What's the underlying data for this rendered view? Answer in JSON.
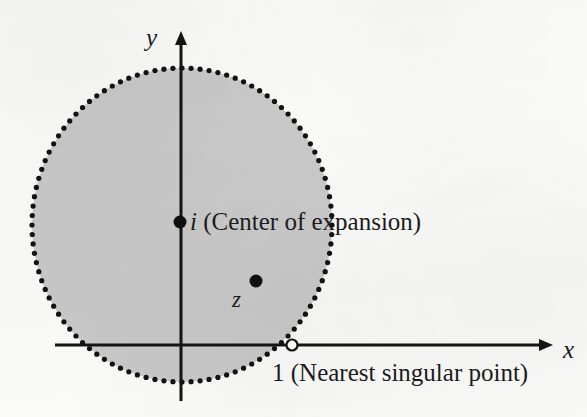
{
  "figure": {
    "kind": "complex-plane-disk-of-convergence",
    "width": 587,
    "height": 417,
    "background_color": "#fbfbfa"
  },
  "axes": {
    "x_axis": {
      "label": "x",
      "label_x": 563,
      "label_y": 337,
      "line_y": 345,
      "line_x_start": 55,
      "line_x_end": 540,
      "arrow_tip_x": 556,
      "color": "#141414",
      "width": 3
    },
    "y_axis": {
      "label": "y",
      "label_x": 146,
      "label_y": 25,
      "line_x": 181,
      "line_y_start": 44,
      "line_y_end": 401,
      "arrow_tip_y": 23,
      "color": "#141414",
      "width": 3
    }
  },
  "disk": {
    "name": "circle-of-convergence",
    "center_x": 182,
    "center_y": 225,
    "radius_x": 150,
    "radius_y": 157,
    "fill_color": "#c9c9c9",
    "boundary_style": "dotted",
    "boundary_color": "#121212",
    "boundary_dot_radius": 2.6,
    "boundary_dot_count": 104
  },
  "points": [
    {
      "id": "center-of-expansion",
      "symbol": "i",
      "annotation": "(Center of expansion)",
      "marker": "filled-dot",
      "x": 180,
      "y": 222,
      "radius": 6.5,
      "color": "#101010",
      "label_x": 190,
      "label_y": 209
    },
    {
      "id": "point-z",
      "symbol": "z",
      "annotation": "",
      "marker": "filled-dot",
      "x": 256,
      "y": 281,
      "radius": 6.5,
      "color": "#101010",
      "label_x": 232,
      "label_y": 288
    },
    {
      "id": "nearest-singular-point",
      "symbol": "1",
      "annotation": "(Nearest singular point)",
      "marker": "open-dot",
      "x": 292,
      "y": 345,
      "radius": 5.5,
      "color": "#151515",
      "label_x": 272,
      "label_y": 360
    }
  ],
  "annotations": {
    "center_label": {
      "symbol": "i",
      "text": " (Center of expansion)"
    },
    "singular_label": {
      "symbol": "1",
      "text": " (Nearest singular point)"
    },
    "z_label": {
      "symbol": "z"
    }
  },
  "chart_data": {
    "type": "scatter",
    "title": "",
    "xlabel": "x",
    "ylabel": "y",
    "grid": false,
    "legend": "none",
    "circle": {
      "center": [
        0,
        1
      ],
      "radius": 1.414,
      "boundary": "dotted",
      "fill": "shaded-gray"
    },
    "points": [
      {
        "label": "i",
        "x": 0,
        "y": 1,
        "marker": "filled",
        "note": "Center of expansion"
      },
      {
        "label": "z",
        "x": 0.49,
        "y": 0.41,
        "marker": "filled",
        "note": "Interior point"
      },
      {
        "label": "1",
        "x": 1,
        "y": 0,
        "marker": "open",
        "note": "Nearest singular point"
      }
    ],
    "xlim": [
      -1.25,
      2.5
    ],
    "ylim": [
      -1.15,
      2.1
    ]
  }
}
